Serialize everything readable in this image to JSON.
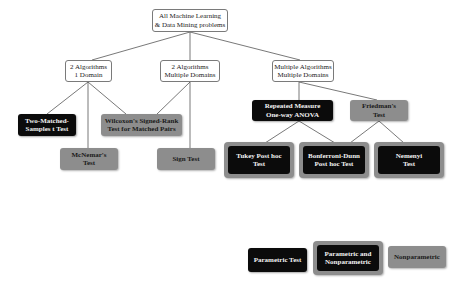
{
  "diagram": {
    "root": {
      "label": "All Machine Learning\n& Data Mining problems"
    },
    "level1": [
      {
        "label": "2 Algorithms\n1 Domain"
      },
      {
        "label": "2 Algorithms\nMultiple Domains"
      },
      {
        "label": "Multiple Algorithms\nMultiple Domains"
      }
    ],
    "tests": {
      "two_matched": {
        "label": "Two-Matched-\nSamples t Test",
        "type": "parametric"
      },
      "mcnemar": {
        "label": "McNemar's\nTest",
        "type": "nonparametric"
      },
      "wilcoxon": {
        "label": "Wilcoxon's Signed-Rank\nTest for Matched Pairs",
        "type": "nonparametric"
      },
      "sign": {
        "label": "Sign Test",
        "type": "nonparametric"
      },
      "anova": {
        "label": "Repeated Measure\nOne-way ANOVA",
        "type": "parametric"
      },
      "friedman": {
        "label": "Friedman's\nTest",
        "type": "nonparametric"
      },
      "tukey": {
        "label": "Tukey Post hoc\nTest",
        "type": "parametric and nonparametric"
      },
      "bonferroni": {
        "label": "Bonferroni-Dunn\nPost hoc Test",
        "type": "parametric and nonparametric"
      },
      "nemenyi": {
        "label": "Nemenyi\nTest",
        "type": "parametric and nonparametric"
      }
    },
    "edges": [
      [
        "root",
        "2 Algorithms 1 Domain"
      ],
      [
        "root",
        "2 Algorithms Multiple Domains"
      ],
      [
        "root",
        "Multiple Algorithms Multiple Domains"
      ],
      [
        "2 Algorithms 1 Domain",
        "Two-Matched-Samples t Test"
      ],
      [
        "2 Algorithms 1 Domain",
        "McNemar's Test"
      ],
      [
        "2 Algorithms 1 Domain",
        "Wilcoxon's Signed-Rank Test for Matched Pairs"
      ],
      [
        "2 Algorithms Multiple Domains",
        "Wilcoxon's Signed-Rank Test for Matched Pairs"
      ],
      [
        "2 Algorithms Multiple Domains",
        "Sign Test"
      ],
      [
        "Multiple Algorithms Multiple Domains",
        "Repeated Measure One-way ANOVA"
      ],
      [
        "Multiple Algorithms Multiple Domains",
        "Friedman's Test"
      ],
      [
        "Repeated Measure One-way ANOVA",
        "Tukey Post hoc Test"
      ],
      [
        "Repeated Measure One-way ANOVA",
        "Bonferroni-Dunn Post hoc Test"
      ],
      [
        "Friedman's Test",
        "Bonferroni-Dunn Post hoc Test"
      ],
      [
        "Friedman's Test",
        "Nemenyi Test"
      ]
    ]
  },
  "legend": {
    "parametric": "Parametric Test",
    "both": "Parametric and\nNonparametric",
    "nonparametric": "Nonparametric"
  },
  "colors": {
    "parametric": "#0b0b0b",
    "nonparametric": "#8d8d8d",
    "category_border": "#7a7a7a",
    "edge": "#555555"
  }
}
